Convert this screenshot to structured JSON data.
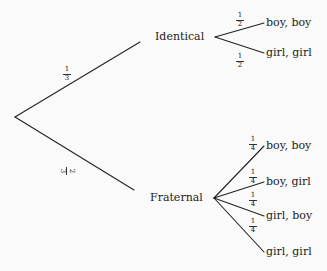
{
  "diagram": {
    "type": "probability-tree",
    "root": {
      "branches": [
        {
          "label": "Identical",
          "probability": {
            "num": "1",
            "den": "3"
          },
          "outcomes": [
            {
              "label": "boy, boy",
              "probability": {
                "num": "1",
                "den": "2"
              }
            },
            {
              "label": "girl, girl",
              "probability": {
                "num": "1",
                "den": "2"
              }
            }
          ]
        },
        {
          "label": "Fraternal",
          "probability": {
            "num": "2",
            "den": "3"
          },
          "outcomes": [
            {
              "label": "boy, boy",
              "probability": {
                "num": "1",
                "den": "4"
              }
            },
            {
              "label": "boy, girl",
              "probability": {
                "num": "1",
                "den": "4"
              }
            },
            {
              "label": "girl, boy",
              "probability": {
                "num": "1",
                "den": "4"
              }
            },
            {
              "label": "girl, girl",
              "probability": {
                "num": "1",
                "den": "4"
              }
            }
          ]
        }
      ]
    },
    "colors": {
      "line": "#222222",
      "background": "#fafafa"
    }
  }
}
